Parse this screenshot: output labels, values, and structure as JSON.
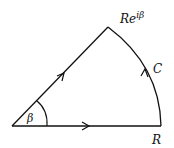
{
  "diagram": {
    "labels": {
      "apex": "Re",
      "apex_sup": "iβ",
      "arc": "C",
      "endpoint": "R",
      "angle": "β"
    },
    "colors": {
      "stroke": "#111111",
      "background": "#ffffff"
    },
    "geometry": {
      "origin": [
        12,
        126
      ],
      "apex": [
        108,
        27
      ],
      "endpoint": [
        161,
        126
      ]
    }
  }
}
